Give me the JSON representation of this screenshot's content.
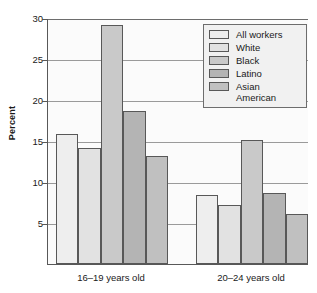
{
  "chart_data": {
    "type": "bar",
    "title": "",
    "subtitle": "",
    "xlabel": "",
    "ylabel": "Percent",
    "ylim": [
      0,
      30
    ],
    "yticks": [
      5,
      10,
      15,
      20,
      25,
      30
    ],
    "ytick_labels": [
      "5",
      "10",
      "15",
      "20",
      "25",
      "30"
    ],
    "grid": true,
    "grid_axis": "y",
    "legend_position": "top-right",
    "categories": [
      "16–19 years old",
      "20–24 years old"
    ],
    "series": [
      {
        "name": "All workers",
        "values": [
          15.9,
          8.4
        ],
        "color": "#eeeeee"
      },
      {
        "name": "White",
        "values": [
          14.2,
          7.2
        ],
        "color": "#e2e2e2"
      },
      {
        "name": "Black",
        "values": [
          29.2,
          15.1
        ],
        "color": "#c9c9c9"
      },
      {
        "name": "Latino",
        "values": [
          18.6,
          8.7
        ],
        "color": "#b4b4b4"
      },
      {
        "name": "Asian\nAmerican",
        "values": [
          13.2,
          6.1
        ],
        "color": "#c0c0c0"
      }
    ],
    "legend_entries": [
      "All workers",
      "White",
      "Black",
      "Latino",
      "Asian\nAmerican"
    ],
    "axis_color": "#585858",
    "gridline_color": "#9a9a9a",
    "plot_background": "#fbfbfb",
    "legend_background": "#f1f1f1"
  }
}
